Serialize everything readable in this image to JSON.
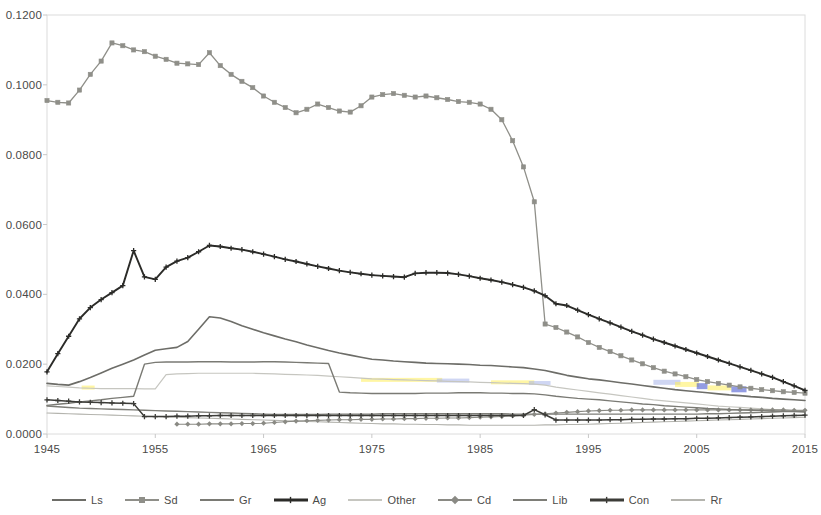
{
  "chart_data": {
    "type": "line",
    "title": "",
    "xlabel": "",
    "ylabel": "",
    "grid": false,
    "legend_position": "bottom",
    "xlim": [
      1945,
      2015
    ],
    "ylim": [
      0.0,
      0.12
    ],
    "ytick_labels": [
      "0.1200",
      "0.1000",
      "0.0800",
      "0.0600",
      "0.0400",
      "0.0200",
      "0.0000"
    ],
    "ytick_values": [
      0.12,
      0.1,
      0.08,
      0.06,
      0.04,
      0.02,
      0.0
    ],
    "xtick_labels": [
      "1945",
      "1955",
      "1965",
      "1975",
      "1985",
      "1995",
      "2005",
      "2015"
    ],
    "xtick_values": [
      1945,
      1955,
      1965,
      1975,
      1985,
      1995,
      2005,
      2015
    ],
    "x": [
      1945,
      1946,
      1947,
      1948,
      1949,
      1950,
      1951,
      1952,
      1953,
      1954,
      1955,
      1956,
      1957,
      1958,
      1959,
      1960,
      1961,
      1962,
      1963,
      1964,
      1965,
      1966,
      1967,
      1968,
      1969,
      1970,
      1971,
      1972,
      1973,
      1974,
      1975,
      1976,
      1977,
      1978,
      1979,
      1980,
      1981,
      1982,
      1983,
      1984,
      1985,
      1986,
      1987,
      1988,
      1989,
      1990,
      1991,
      1992,
      1993,
      1994,
      1995,
      1996,
      1997,
      1998,
      1999,
      2000,
      2001,
      2002,
      2003,
      2004,
      2005,
      2006,
      2007,
      2008,
      2009,
      2010,
      2011,
      2012,
      2013,
      2014,
      2015
    ],
    "series": [
      {
        "name": "Ls",
        "color": "#6d6d68",
        "marker": "none",
        "linewidth": 1.6,
        "values": [
          0.0145,
          0.0142,
          0.014,
          0.015,
          0.0162,
          0.0175,
          0.0188,
          0.02,
          0.0212,
          0.0226,
          0.024,
          0.0244,
          0.0248,
          0.0265,
          0.03,
          0.0336,
          0.0332,
          0.0322,
          0.031,
          0.03,
          0.029,
          0.0281,
          0.0272,
          0.0264,
          0.0255,
          0.0247,
          0.0239,
          0.0232,
          0.0226,
          0.022,
          0.0214,
          0.0212,
          0.0209,
          0.0207,
          0.0205,
          0.0203,
          0.0202,
          0.0201,
          0.02,
          0.0199,
          0.0197,
          0.0196,
          0.0194,
          0.0192,
          0.019,
          0.0186,
          0.0182,
          0.0175,
          0.0168,
          0.0163,
          0.0158,
          0.0155,
          0.0151,
          0.0147,
          0.0143,
          0.0139,
          0.0135,
          0.0131,
          0.0127,
          0.0124,
          0.0121,
          0.0118,
          0.0115,
          0.0112,
          0.011,
          0.0107,
          0.0105,
          0.0102,
          0.01,
          0.0098,
          0.0096
        ]
      },
      {
        "name": "Sd",
        "color": "#8f8f89",
        "marker": "square",
        "linewidth": 1.3,
        "values": [
          0.0955,
          0.095,
          0.0948,
          0.0985,
          0.103,
          0.1068,
          0.112,
          0.1112,
          0.11,
          0.1095,
          0.1082,
          0.1073,
          0.1062,
          0.106,
          0.1058,
          0.1092,
          0.1055,
          0.103,
          0.101,
          0.0992,
          0.0968,
          0.095,
          0.0935,
          0.092,
          0.093,
          0.0945,
          0.0935,
          0.0925,
          0.0922,
          0.094,
          0.0965,
          0.0972,
          0.0975,
          0.097,
          0.0965,
          0.0968,
          0.0963,
          0.0958,
          0.0952,
          0.095,
          0.0945,
          0.093,
          0.09,
          0.084,
          0.0765,
          0.0665,
          0.0315,
          0.0305,
          0.0292,
          0.0278,
          0.0262,
          0.0248,
          0.0236,
          0.0224,
          0.0212,
          0.0201,
          0.019,
          0.018,
          0.0172,
          0.0164,
          0.0156,
          0.015,
          0.0145,
          0.014,
          0.0135,
          0.0131,
          0.0127,
          0.0124,
          0.0121,
          0.0119,
          0.0117
        ]
      },
      {
        "name": "Gr",
        "color": "#7a7a74",
        "marker": "none",
        "linewidth": 1.4,
        "values": [
          0.0082,
          0.0085,
          0.0088,
          0.0092,
          0.0095,
          0.0098,
          0.0102,
          0.0105,
          0.0108,
          0.02,
          0.0205,
          0.0206,
          0.0206,
          0.0206,
          0.0207,
          0.0207,
          0.0207,
          0.0206,
          0.0206,
          0.0206,
          0.0207,
          0.0207,
          0.0206,
          0.0205,
          0.0204,
          0.0203,
          0.0202,
          0.012,
          0.0118,
          0.0117,
          0.0116,
          0.0116,
          0.0116,
          0.0116,
          0.0116,
          0.0117,
          0.0117,
          0.0117,
          0.0118,
          0.0118,
          0.0118,
          0.0117,
          0.0117,
          0.0116,
          0.0116,
          0.0115,
          0.0112,
          0.0108,
          0.0105,
          0.0102,
          0.01,
          0.0098,
          0.0095,
          0.0092,
          0.0089,
          0.0086,
          0.0084,
          0.0081,
          0.0079,
          0.0077,
          0.0075,
          0.0073,
          0.0072,
          0.007,
          0.0069,
          0.0068,
          0.0067,
          0.0066,
          0.0065,
          0.0064,
          0.0063
        ]
      },
      {
        "name": "Ag",
        "color": "#2b2b28",
        "marker": "plus",
        "linewidth": 1.9,
        "values": [
          0.0178,
          0.023,
          0.028,
          0.033,
          0.0362,
          0.0385,
          0.0405,
          0.0425,
          0.0525,
          0.045,
          0.0443,
          0.0478,
          0.0495,
          0.0505,
          0.0522,
          0.054,
          0.0537,
          0.0532,
          0.0528,
          0.0522,
          0.0515,
          0.0508,
          0.05,
          0.0494,
          0.0487,
          0.048,
          0.0474,
          0.0468,
          0.0463,
          0.0459,
          0.0455,
          0.0453,
          0.0451,
          0.0449,
          0.046,
          0.0462,
          0.0462,
          0.0461,
          0.0457,
          0.0452,
          0.0446,
          0.0441,
          0.0435,
          0.0428,
          0.042,
          0.041,
          0.0396,
          0.0373,
          0.0368,
          0.0355,
          0.0342,
          0.033,
          0.0318,
          0.0306,
          0.0294,
          0.0283,
          0.0272,
          0.0262,
          0.0252,
          0.0242,
          0.0232,
          0.0222,
          0.0212,
          0.0202,
          0.0192,
          0.0182,
          0.0172,
          0.0162,
          0.015,
          0.0138,
          0.0125
        ]
      },
      {
        "name": "Other",
        "color": "#c6c6c0",
        "marker": "none",
        "linewidth": 1.2,
        "values": [
          0.0138,
          0.0136,
          0.0134,
          0.0132,
          0.0131,
          0.013,
          0.013,
          0.013,
          0.013,
          0.0129,
          0.0129,
          0.017,
          0.0172,
          0.0173,
          0.0174,
          0.0174,
          0.0174,
          0.0174,
          0.0174,
          0.0174,
          0.0173,
          0.0172,
          0.0171,
          0.017,
          0.0169,
          0.0168,
          0.0166,
          0.0164,
          0.0162,
          0.016,
          0.0158,
          0.0157,
          0.0156,
          0.0155,
          0.0154,
          0.0153,
          0.0152,
          0.0151,
          0.015,
          0.0149,
          0.0148,
          0.0147,
          0.0146,
          0.0145,
          0.0144,
          0.0143,
          0.014,
          0.0134,
          0.013,
          0.0126,
          0.0122,
          0.0118,
          0.0114,
          0.011,
          0.0106,
          0.0102,
          0.0098,
          0.0095,
          0.0092,
          0.0089,
          0.0086,
          0.0083,
          0.008,
          0.0078,
          0.0076,
          0.0074,
          0.0072,
          0.007,
          0.0068,
          0.0066,
          0.0064
        ]
      },
      {
        "name": "Cd",
        "color": "#8a8a84",
        "marker": "diamond",
        "linewidth": 1.1,
        "start_index": 12,
        "values": [
          null,
          null,
          null,
          null,
          null,
          null,
          null,
          null,
          null,
          null,
          null,
          null,
          0.0028,
          0.0028,
          0.0028,
          0.0029,
          0.0029,
          0.0029,
          0.003,
          0.003,
          0.0031,
          0.0033,
          0.0035,
          0.0037,
          0.0038,
          0.0039,
          0.004,
          0.0041,
          0.0041,
          0.0042,
          0.0042,
          0.0043,
          0.0043,
          0.0044,
          0.0044,
          0.0045,
          0.0045,
          0.0046,
          0.0046,
          0.0047,
          0.0048,
          0.0049,
          0.005,
          0.0052,
          0.0054,
          0.0056,
          0.0058,
          0.006,
          0.0062,
          0.0064,
          0.0066,
          0.0067,
          0.0068,
          0.0068,
          0.0069,
          0.0069,
          0.0069,
          0.0069,
          0.0069,
          0.0069,
          0.0069,
          0.0069,
          0.0069,
          0.0069,
          0.0069,
          0.0069,
          0.0069,
          0.0069,
          0.0069,
          0.0068,
          0.0068
        ]
      },
      {
        "name": "Lib",
        "color": "#7e7e78",
        "marker": "none",
        "linewidth": 1.4,
        "values": [
          0.008,
          0.0078,
          0.0076,
          0.0074,
          0.0073,
          0.0072,
          0.0071,
          0.007,
          0.0069,
          0.0068,
          0.0067,
          0.0066,
          0.0065,
          0.0064,
          0.0063,
          0.0062,
          0.0061,
          0.006,
          0.0059,
          0.0058,
          0.0057,
          0.0056,
          0.0056,
          0.0056,
          0.0056,
          0.0056,
          0.0057,
          0.0057,
          0.0057,
          0.0057,
          0.0057,
          0.0058,
          0.0058,
          0.0058,
          0.0058,
          0.0058,
          0.0058,
          0.0058,
          0.0058,
          0.0058,
          0.0058,
          0.0058,
          0.0058,
          0.0057,
          0.0057,
          0.0057,
          0.0057,
          0.0057,
          0.0057,
          0.0057,
          0.0057,
          0.0057,
          0.0057,
          0.0057,
          0.0057,
          0.0057,
          0.0057,
          0.0057,
          0.0057,
          0.0057,
          0.0057,
          0.0058,
          0.0058,
          0.0059,
          0.006,
          0.0061,
          0.0062,
          0.0063,
          0.0064,
          0.0065,
          0.0066
        ]
      },
      {
        "name": "Con",
        "color": "#3c3c38",
        "marker": "plus",
        "linewidth": 1.5,
        "values": [
          0.0098,
          0.0096,
          0.0094,
          0.0092,
          0.0091,
          0.009,
          0.0089,
          0.0088,
          0.0087,
          0.005,
          0.005,
          0.005,
          0.0051,
          0.0051,
          0.0052,
          0.0052,
          0.0053,
          0.0053,
          0.0053,
          0.0053,
          0.0053,
          0.0053,
          0.0053,
          0.0053,
          0.0053,
          0.0053,
          0.0053,
          0.0053,
          0.0053,
          0.0053,
          0.0053,
          0.0053,
          0.0053,
          0.0053,
          0.0053,
          0.0053,
          0.0053,
          0.0053,
          0.0053,
          0.0053,
          0.0053,
          0.0053,
          0.0053,
          0.0053,
          0.0053,
          0.007,
          0.0055,
          0.004,
          0.004,
          0.004,
          0.004,
          0.004,
          0.0041,
          0.0041,
          0.0042,
          0.0042,
          0.0043,
          0.0043,
          0.0044,
          0.0044,
          0.0045,
          0.0045,
          0.0046,
          0.0047,
          0.0048,
          0.0049,
          0.005,
          0.0051,
          0.0052,
          0.0053,
          0.0054
        ]
      },
      {
        "name": "Rr",
        "color": "#b4b4ae",
        "marker": "none",
        "linewidth": 1.1,
        "values": [
          0.006,
          0.0059,
          0.0058,
          0.0057,
          0.0056,
          0.0055,
          0.0054,
          0.0053,
          0.0052,
          0.0051,
          0.005,
          0.0049,
          0.0048,
          0.0047,
          0.0046,
          0.0045,
          0.0044,
          0.0043,
          0.0042,
          0.0041,
          0.004,
          0.0039,
          0.0038,
          0.0037,
          0.0036,
          0.0035,
          0.0034,
          0.0033,
          0.0032,
          0.0031,
          0.003,
          0.0029,
          0.0029,
          0.0028,
          0.0028,
          0.0027,
          0.0027,
          0.0026,
          0.0026,
          0.0025,
          0.0025,
          0.0025,
          0.0025,
          0.0025,
          0.0025,
          0.0025,
          0.0026,
          0.0026,
          0.0027,
          0.0027,
          0.0028,
          0.0029,
          0.003,
          0.0031,
          0.0032,
          0.0033,
          0.0034,
          0.0035,
          0.0036,
          0.0037,
          0.0038,
          0.0039,
          0.004,
          0.0041,
          0.0042,
          0.0043,
          0.0044,
          0.0045,
          0.0046,
          0.0047,
          0.0048
        ]
      }
    ]
  },
  "legend": {
    "items": [
      {
        "label": "Ls",
        "color": "#6d6d68",
        "marker": "none",
        "icon": "line-swatch-icon"
      },
      {
        "label": "Sd",
        "color": "#8f8f89",
        "marker": "square",
        "icon": "line-swatch-icon"
      },
      {
        "label": "Gr",
        "color": "#7a7a74",
        "marker": "none",
        "icon": "line-swatch-icon"
      },
      {
        "label": "Ag",
        "color": "#2b2b28",
        "marker": "plus",
        "icon": "line-swatch-icon"
      },
      {
        "label": "Other",
        "color": "#c6c6c0",
        "marker": "none",
        "icon": "line-swatch-icon"
      },
      {
        "label": "Cd",
        "color": "#8a8a84",
        "marker": "diamond",
        "icon": "line-swatch-icon"
      },
      {
        "label": "Lib",
        "color": "#7e7e78",
        "marker": "none",
        "icon": "line-swatch-icon"
      },
      {
        "label": "Con",
        "color": "#3c3c38",
        "marker": "plus",
        "icon": "line-swatch-icon"
      },
      {
        "label": "Rr",
        "color": "#b4b4ae",
        "marker": "none",
        "icon": "line-swatch-icon"
      }
    ]
  },
  "axes": {
    "border_color": "#dcdcdc",
    "tick_color": "#c8c8c8",
    "label_color": "#4a4a48"
  },
  "highlights": [
    {
      "color": "#ffef5a",
      "x0": 1948.2,
      "x1": 1949.4,
      "y": 0.0133,
      "h": 4
    },
    {
      "color": "#ffef5a",
      "x0": 1974.0,
      "x1": 1981.5,
      "y": 0.0155,
      "h": 4
    },
    {
      "color": "#a8b4ea",
      "x0": 1981.0,
      "x1": 1984.0,
      "y": 0.0153,
      "h": 4
    },
    {
      "color": "#ffef5a",
      "x0": 1986.0,
      "x1": 1990.0,
      "y": 0.0148,
      "h": 4
    },
    {
      "color": "#a8b4ea",
      "x0": 1989.5,
      "x1": 1991.5,
      "y": 0.0146,
      "h": 4
    },
    {
      "color": "#a8b4ea",
      "x0": 2001.0,
      "x1": 2003.5,
      "y": 0.0148,
      "h": 5
    },
    {
      "color": "#ffef5a",
      "x0": 2003.0,
      "x1": 2005.2,
      "y": 0.0142,
      "h": 5
    },
    {
      "color": "#3a4acc",
      "x0": 2005.0,
      "x1": 2006.0,
      "y": 0.0137,
      "h": 6
    },
    {
      "color": "#ffef5a",
      "x0": 2006.0,
      "x1": 2008.2,
      "y": 0.0132,
      "h": 5
    },
    {
      "color": "#3a4acc",
      "x0": 2008.2,
      "x1": 2009.6,
      "y": 0.0128,
      "h": 6
    }
  ]
}
